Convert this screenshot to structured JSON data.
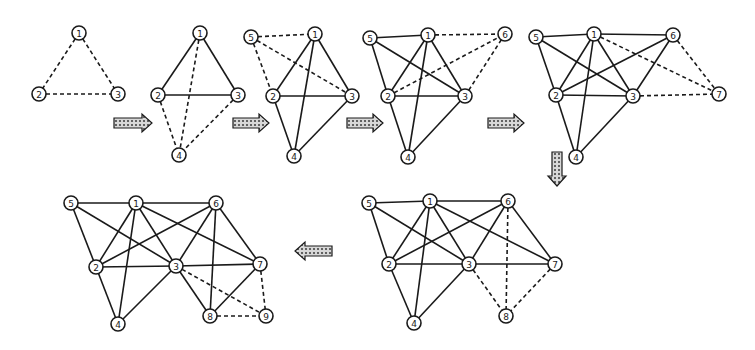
{
  "node_radius": 7,
  "colors": {
    "stroke": "#1a1a1a",
    "background": "#ffffff"
  },
  "panels": [
    {
      "name": "step-1",
      "nodes": [
        {
          "id": "1",
          "x": 79,
          "y": 33
        },
        {
          "id": "2",
          "x": 39,
          "y": 94
        },
        {
          "id": "3",
          "x": 118,
          "y": 94
        }
      ],
      "edges": [
        {
          "from": "1",
          "to": "2",
          "style": "dashed"
        },
        {
          "from": "1",
          "to": "3",
          "style": "dashed"
        },
        {
          "from": "2",
          "to": "3",
          "style": "dashed"
        }
      ]
    },
    {
      "name": "step-2",
      "nodes": [
        {
          "id": "1",
          "x": 200,
          "y": 33
        },
        {
          "id": "2",
          "x": 158,
          "y": 95
        },
        {
          "id": "3",
          "x": 238,
          "y": 95
        },
        {
          "id": "4",
          "x": 179,
          "y": 155
        }
      ],
      "edges": [
        {
          "from": "1",
          "to": "2",
          "style": "solid"
        },
        {
          "from": "1",
          "to": "3",
          "style": "solid"
        },
        {
          "from": "2",
          "to": "3",
          "style": "solid"
        },
        {
          "from": "1",
          "to": "4",
          "style": "dashed"
        },
        {
          "from": "2",
          "to": "4",
          "style": "dashed"
        },
        {
          "from": "3",
          "to": "4",
          "style": "dashed"
        }
      ]
    },
    {
      "name": "step-3",
      "nodes": [
        {
          "id": "5",
          "x": 251,
          "y": 37
        },
        {
          "id": "1",
          "x": 315,
          "y": 34
        },
        {
          "id": "2",
          "x": 273,
          "y": 96
        },
        {
          "id": "3",
          "x": 352,
          "y": 96
        },
        {
          "id": "4",
          "x": 294,
          "y": 156
        }
      ],
      "edges": [
        {
          "from": "1",
          "to": "2",
          "style": "solid"
        },
        {
          "from": "1",
          "to": "3",
          "style": "solid"
        },
        {
          "from": "1",
          "to": "4",
          "style": "solid"
        },
        {
          "from": "2",
          "to": "3",
          "style": "solid"
        },
        {
          "from": "2",
          "to": "4",
          "style": "solid"
        },
        {
          "from": "3",
          "to": "4",
          "style": "solid"
        },
        {
          "from": "5",
          "to": "1",
          "style": "dashed"
        },
        {
          "from": "5",
          "to": "2",
          "style": "dashed"
        },
        {
          "from": "5",
          "to": "3",
          "style": "dashed"
        }
      ]
    },
    {
      "name": "step-4",
      "nodes": [
        {
          "id": "5",
          "x": 370,
          "y": 38
        },
        {
          "id": "1",
          "x": 428,
          "y": 35
        },
        {
          "id": "6",
          "x": 505,
          "y": 34
        },
        {
          "id": "2",
          "x": 388,
          "y": 96
        },
        {
          "id": "3",
          "x": 465,
          "y": 96
        },
        {
          "id": "4",
          "x": 408,
          "y": 157
        }
      ],
      "edges": [
        {
          "from": "5",
          "to": "1",
          "style": "solid"
        },
        {
          "from": "5",
          "to": "2",
          "style": "solid"
        },
        {
          "from": "5",
          "to": "3",
          "style": "solid"
        },
        {
          "from": "1",
          "to": "2",
          "style": "solid"
        },
        {
          "from": "1",
          "to": "3",
          "style": "solid"
        },
        {
          "from": "1",
          "to": "4",
          "style": "solid"
        },
        {
          "from": "2",
          "to": "3",
          "style": "solid"
        },
        {
          "from": "2",
          "to": "4",
          "style": "solid"
        },
        {
          "from": "3",
          "to": "4",
          "style": "solid"
        },
        {
          "from": "1",
          "to": "6",
          "style": "dashed"
        },
        {
          "from": "2",
          "to": "6",
          "style": "dashed"
        },
        {
          "from": "3",
          "to": "6",
          "style": "dashed"
        }
      ]
    },
    {
      "name": "step-5",
      "nodes": [
        {
          "id": "5",
          "x": 536,
          "y": 37
        },
        {
          "id": "1",
          "x": 594,
          "y": 34
        },
        {
          "id": "6",
          "x": 673,
          "y": 35
        },
        {
          "id": "2",
          "x": 556,
          "y": 95
        },
        {
          "id": "3",
          "x": 633,
          "y": 96
        },
        {
          "id": "4",
          "x": 576,
          "y": 157
        },
        {
          "id": "7",
          "x": 719,
          "y": 94
        }
      ],
      "edges": [
        {
          "from": "5",
          "to": "1",
          "style": "solid"
        },
        {
          "from": "5",
          "to": "2",
          "style": "solid"
        },
        {
          "from": "5",
          "to": "3",
          "style": "solid"
        },
        {
          "from": "1",
          "to": "6",
          "style": "solid"
        },
        {
          "from": "1",
          "to": "2",
          "style": "solid"
        },
        {
          "from": "1",
          "to": "3",
          "style": "solid"
        },
        {
          "from": "1",
          "to": "4",
          "style": "solid"
        },
        {
          "from": "2",
          "to": "3",
          "style": "solid"
        },
        {
          "from": "2",
          "to": "6",
          "style": "solid"
        },
        {
          "from": "3",
          "to": "6",
          "style": "solid"
        },
        {
          "from": "2",
          "to": "4",
          "style": "solid"
        },
        {
          "from": "3",
          "to": "4",
          "style": "solid"
        },
        {
          "from": "1",
          "to": "7",
          "style": "dashed"
        },
        {
          "from": "6",
          "to": "7",
          "style": "dashed"
        },
        {
          "from": "3",
          "to": "7",
          "style": "dashed"
        }
      ]
    },
    {
      "name": "step-6",
      "nodes": [
        {
          "id": "5",
          "x": 369,
          "y": 203
        },
        {
          "id": "1",
          "x": 430,
          "y": 201
        },
        {
          "id": "6",
          "x": 508,
          "y": 201
        },
        {
          "id": "2",
          "x": 389,
          "y": 264
        },
        {
          "id": "3",
          "x": 469,
          "y": 264
        },
        {
          "id": "7",
          "x": 555,
          "y": 264
        },
        {
          "id": "4",
          "x": 414,
          "y": 323
        },
        {
          "id": "8",
          "x": 506,
          "y": 316
        }
      ],
      "edges": [
        {
          "from": "5",
          "to": "1",
          "style": "solid"
        },
        {
          "from": "5",
          "to": "2",
          "style": "solid"
        },
        {
          "from": "5",
          "to": "3",
          "style": "solid"
        },
        {
          "from": "1",
          "to": "6",
          "style": "solid"
        },
        {
          "from": "1",
          "to": "2",
          "style": "solid"
        },
        {
          "from": "1",
          "to": "3",
          "style": "solid"
        },
        {
          "from": "1",
          "to": "4",
          "style": "solid"
        },
        {
          "from": "1",
          "to": "7",
          "style": "solid"
        },
        {
          "from": "2",
          "to": "3",
          "style": "solid"
        },
        {
          "from": "2",
          "to": "6",
          "style": "solid"
        },
        {
          "from": "3",
          "to": "6",
          "style": "solid"
        },
        {
          "from": "6",
          "to": "7",
          "style": "solid"
        },
        {
          "from": "3",
          "to": "7",
          "style": "solid"
        },
        {
          "from": "2",
          "to": "4",
          "style": "solid"
        },
        {
          "from": "3",
          "to": "4",
          "style": "solid"
        },
        {
          "from": "6",
          "to": "8",
          "style": "dashed"
        },
        {
          "from": "3",
          "to": "8",
          "style": "dashed"
        },
        {
          "from": "7",
          "to": "8",
          "style": "dashed"
        }
      ]
    },
    {
      "name": "step-7",
      "nodes": [
        {
          "id": "5",
          "x": 71,
          "y": 203
        },
        {
          "id": "1",
          "x": 136,
          "y": 203
        },
        {
          "id": "6",
          "x": 216,
          "y": 203
        },
        {
          "id": "2",
          "x": 96,
          "y": 267
        },
        {
          "id": "3",
          "x": 176,
          "y": 266
        },
        {
          "id": "7",
          "x": 260,
          "y": 264
        },
        {
          "id": "4",
          "x": 118,
          "y": 324
        },
        {
          "id": "8",
          "x": 210,
          "y": 316
        },
        {
          "id": "9",
          "x": 266,
          "y": 316
        }
      ],
      "edges": [
        {
          "from": "5",
          "to": "1",
          "style": "solid"
        },
        {
          "from": "5",
          "to": "2",
          "style": "solid"
        },
        {
          "from": "5",
          "to": "3",
          "style": "solid"
        },
        {
          "from": "1",
          "to": "6",
          "style": "solid"
        },
        {
          "from": "1",
          "to": "2",
          "style": "solid"
        },
        {
          "from": "1",
          "to": "3",
          "style": "solid"
        },
        {
          "from": "1",
          "to": "4",
          "style": "solid"
        },
        {
          "from": "1",
          "to": "7",
          "style": "solid"
        },
        {
          "from": "2",
          "to": "3",
          "style": "solid"
        },
        {
          "from": "2",
          "to": "6",
          "style": "solid"
        },
        {
          "from": "3",
          "to": "6",
          "style": "solid"
        },
        {
          "from": "6",
          "to": "7",
          "style": "solid"
        },
        {
          "from": "3",
          "to": "7",
          "style": "solid"
        },
        {
          "from": "2",
          "to": "4",
          "style": "solid"
        },
        {
          "from": "3",
          "to": "4",
          "style": "solid"
        },
        {
          "from": "6",
          "to": "8",
          "style": "solid"
        },
        {
          "from": "3",
          "to": "8",
          "style": "solid"
        },
        {
          "from": "7",
          "to": "8",
          "style": "solid"
        },
        {
          "from": "3",
          "to": "9",
          "style": "dashed"
        },
        {
          "from": "7",
          "to": "9",
          "style": "dashed"
        },
        {
          "from": "8",
          "to": "9",
          "style": "dashed"
        }
      ]
    }
  ],
  "arrows": [
    {
      "name": "arrow-step1-to-step2",
      "direction": "right",
      "x": 114,
      "y": 123,
      "length": 38
    },
    {
      "name": "arrow-step2-to-step3",
      "direction": "right",
      "x": 233,
      "y": 123,
      "length": 36
    },
    {
      "name": "arrow-step3-to-step4",
      "direction": "right",
      "x": 347,
      "y": 123,
      "length": 36
    },
    {
      "name": "arrow-step4-to-step5",
      "direction": "right",
      "x": 488,
      "y": 123,
      "length": 36
    },
    {
      "name": "arrow-step5-to-step6",
      "direction": "down",
      "x": 557,
      "y": 152,
      "length": 34
    },
    {
      "name": "arrow-step6-to-step7",
      "direction": "left",
      "x": 332,
      "y": 251,
      "length": 37
    }
  ]
}
